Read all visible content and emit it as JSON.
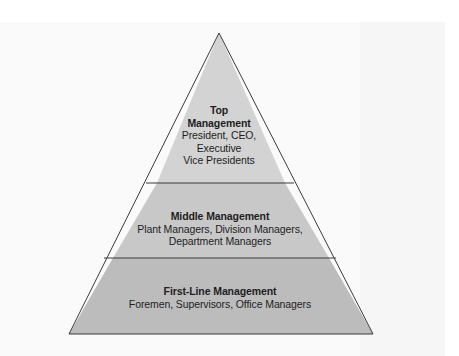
{
  "diagram": {
    "type": "pyramid",
    "colors": {
      "tier_top": "#d3d3d3",
      "tier_middle": "#c8c8c8",
      "tier_bottom": "#bcbcbc",
      "outline": "#3a3a3a",
      "text": "#1e1e1e"
    },
    "tiers": [
      {
        "title_line1": "Top",
        "title_line2": "Management",
        "desc_line1": "President, CEO,",
        "desc_line2": "Executive",
        "desc_line3": "Vice Presidents"
      },
      {
        "title": "Middle Management",
        "desc_line1": "Plant Managers, Division Managers,",
        "desc_line2": "Department Managers"
      },
      {
        "title": "First-Line Management",
        "desc_line1": "Foremen, Supervisors, Office Managers"
      }
    ]
  }
}
